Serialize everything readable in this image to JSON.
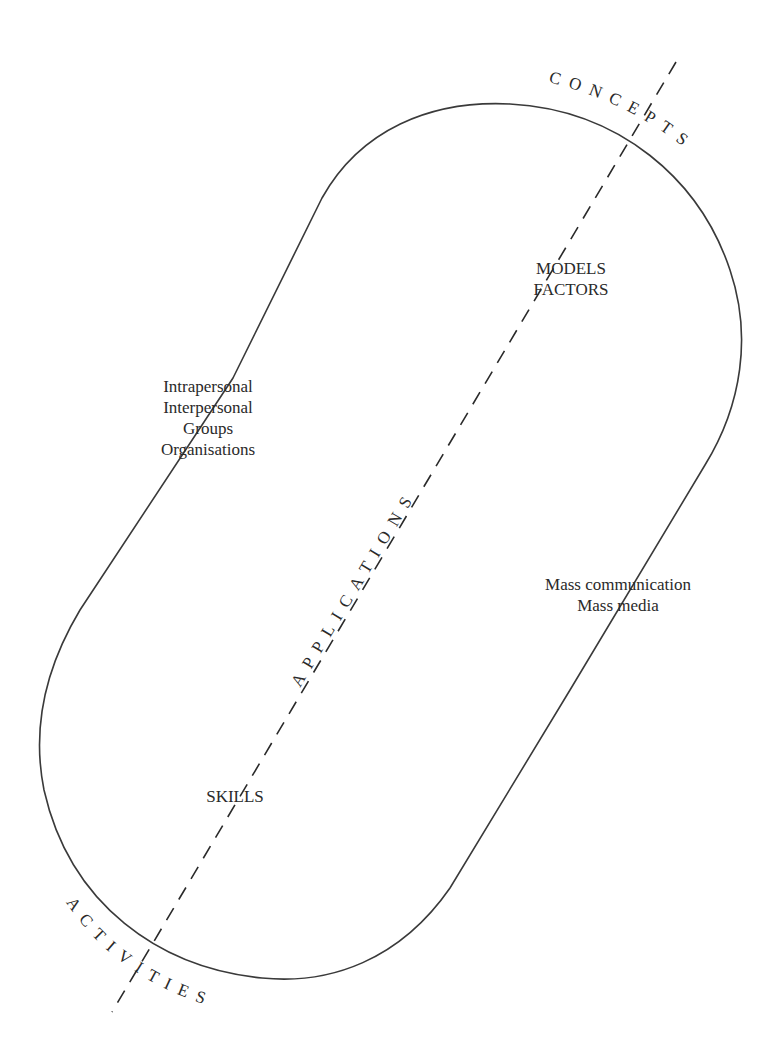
{
  "diagram": {
    "title": "",
    "outer_labels": {
      "top": "CONCEPTS",
      "bottom": "ACTIVITIES"
    },
    "axis_label": "APPLICATIONS",
    "inner_labels": {
      "models": [
        "MODELS",
        "FACTORS"
      ],
      "levels": [
        "Intrapersonal",
        "Interpersonal",
        "Groups",
        "Organisations"
      ],
      "mass": [
        "Mass communication",
        "Mass media"
      ],
      "skills": "SKILLS"
    },
    "shape": "rotated stadium outline with dashed diagonal axis",
    "colors": {
      "stroke": "#3a3a3a",
      "text": "#2a2a2a",
      "background": "#ffffff"
    }
  }
}
